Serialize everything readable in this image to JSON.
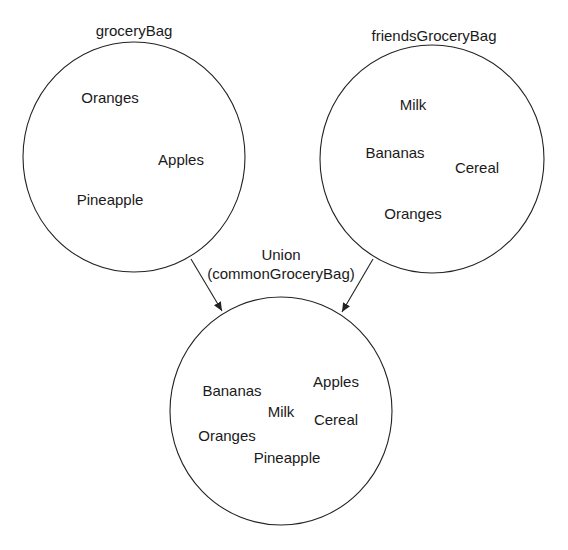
{
  "diagram": {
    "sets": [
      {
        "id": "groceryBag",
        "label": "groceryBag",
        "items": [
          "Oranges",
          "Apples",
          "Pineapple"
        ]
      },
      {
        "id": "friendsGroceryBag",
        "label": "friendsGroceryBag",
        "items": [
          "Milk",
          "Bananas",
          "Cereal",
          "Oranges"
        ]
      },
      {
        "id": "commonGroceryBag",
        "label": "",
        "items": [
          "Apples",
          "Bananas",
          "Milk",
          "Cereal",
          "Oranges",
          "Pineapple"
        ]
      }
    ],
    "operation": {
      "label_line1": "Union",
      "label_line2": "(commonGroceryBag)"
    }
  }
}
